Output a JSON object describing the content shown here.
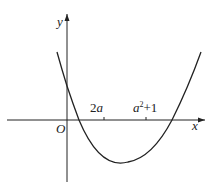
{
  "diagram": {
    "type": "parabola-graph",
    "axis_labels": {
      "x": "x",
      "y": "y",
      "origin": "O"
    },
    "tick_labels": [
      {
        "id": "t1",
        "coef": "2",
        "var": "a",
        "text": "2a"
      },
      {
        "id": "t2",
        "var": "a",
        "sup": "2",
        "tail": "+1",
        "text": "a²+1"
      }
    ],
    "curve": "upward-opening parabola crossing positive y-axis, two positive x-intercepts, vertex below x-axis",
    "colors": {
      "stroke": "#222222",
      "background": "#ffffff"
    }
  }
}
